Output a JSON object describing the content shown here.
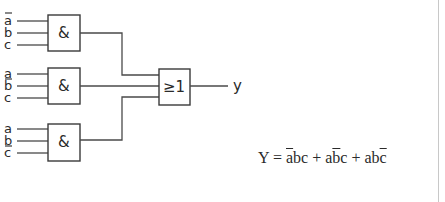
{
  "diagram": {
    "type": "logic-circuit",
    "and_gates": [
      {
        "symbol": "&",
        "inputs": [
          {
            "label": "a",
            "negated": true
          },
          {
            "label": "b",
            "negated": false
          },
          {
            "label": "c",
            "negated": false
          }
        ]
      },
      {
        "symbol": "&",
        "inputs": [
          {
            "label": "a",
            "negated": false
          },
          {
            "label": "b",
            "negated": true
          },
          {
            "label": "c",
            "negated": false
          }
        ]
      },
      {
        "symbol": "&",
        "inputs": [
          {
            "label": "a",
            "negated": false
          },
          {
            "label": "b",
            "negated": false
          },
          {
            "label": "c",
            "negated": true
          }
        ]
      }
    ],
    "or_gate": {
      "symbol": "≥1"
    },
    "output_label": "y",
    "equation": {
      "lhs": "Y",
      "equals": "=",
      "plus": "+",
      "terms": [
        {
          "t1": "a",
          "t2": "b",
          "t3": "c",
          "negated": 1
        },
        {
          "t1": "a",
          "t2": "b",
          "t3": "c",
          "negated": 2
        },
        {
          "t1": "a",
          "t2": "b",
          "t3": "c",
          "negated": 3
        }
      ]
    }
  },
  "colors": {
    "line": "#4a4a4a",
    "background": "#ffffff"
  }
}
